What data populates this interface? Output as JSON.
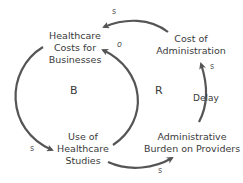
{
  "diagram": {
    "type": "causal-loop-diagram",
    "nodes": {
      "healthcare_costs": {
        "line1": "Healthcare",
        "line2": "Costs for",
        "line3": "Businesses"
      },
      "cost_admin": {
        "line1": "Cost of",
        "line2": "Administration"
      },
      "use_studies": {
        "line1": "Use of",
        "line2": "Healthcare",
        "line3": "Studies"
      },
      "admin_burden": {
        "line1": "Administrative",
        "line2": "Burden on Providers"
      }
    },
    "loops": {
      "balancing": "B",
      "reinforcing": "R"
    },
    "links": {
      "cost_admin_to_healthcare_costs": "s",
      "use_studies_to_healthcare_costs": "o",
      "healthcare_costs_to_use_studies": "s",
      "use_studies_to_admin_burden": "s",
      "admin_burden_to_cost_admin": "s"
    },
    "delay_label": "Delay",
    "colors": {
      "arrow": "#555555",
      "text": "#3a3a3a",
      "background": "#ffffff"
    }
  }
}
